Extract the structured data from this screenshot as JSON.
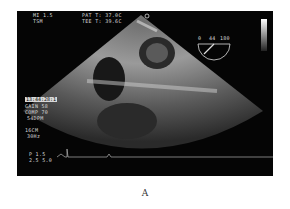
{
  "header": {
    "mi": "MI 1.5",
    "tis": "TSM",
    "pat_temp": "PAT T: 37.0C",
    "tee_temp": "TEE T: 39.6C"
  },
  "left_panel": {
    "timestamp": "13:44:28:1",
    "gain": "GAIN 58",
    "comp": "COMP 70",
    "rate": "54DPM",
    "depth": "16CM",
    "frame_rate": "30Hz"
  },
  "probe": {
    "angle_label": "0",
    "angle_value": "44",
    "angle_max": "180"
  },
  "bottom_left": {
    "line1": "P 1.5",
    "line2": "2.5 5.0"
  },
  "caption": "A"
}
